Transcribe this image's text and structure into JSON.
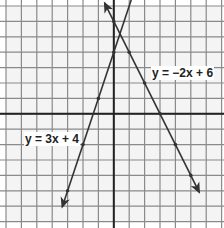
{
  "graph": {
    "grid": {
      "xmin": -7,
      "xmax": 7,
      "ymin": -7,
      "ymax": 7,
      "step": 1
    },
    "colors": {
      "grid": "#8a8a8a",
      "axis": "#222222",
      "line": "#333333",
      "background": "#f4f4f4"
    },
    "lines": [
      {
        "label": "y = 3x + 4",
        "slope": 3,
        "intercept": 4,
        "points": [
          [
            -3,
            -5
          ],
          [
            -2,
            -2
          ],
          [
            -1,
            1
          ],
          [
            0,
            4
          ]
        ]
      },
      {
        "label": "y = −2x + 6",
        "slope": -2,
        "intercept": 6,
        "points": [
          [
            0,
            6
          ],
          [
            1,
            4
          ],
          [
            2,
            2
          ],
          [
            3,
            0
          ],
          [
            4,
            -2
          ],
          [
            5,
            -4
          ]
        ]
      }
    ]
  },
  "labels": {
    "line1": "y = 3x + 4",
    "line2": "y = −2x + 6"
  }
}
